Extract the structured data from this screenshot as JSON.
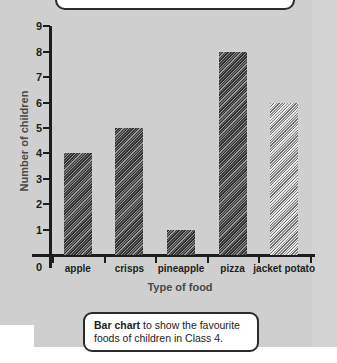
{
  "chart_data": {
    "type": "bar",
    "title": "",
    "categories": [
      "apple",
      "crisps",
      "pineapple",
      "pizza",
      "jacket potato"
    ],
    "values": [
      4,
      5,
      1,
      8,
      6
    ],
    "xlabel": "Type of food",
    "ylabel": "Number of children",
    "ylim": [
      0,
      9
    ],
    "y_ticks": [
      9,
      8,
      7,
      6,
      5,
      4,
      3,
      2,
      1
    ],
    "y_zero_label": "0",
    "grid": false,
    "legend": "none",
    "bar_styles": [
      "dark-hatch",
      "dark-hatch",
      "dark-hatch",
      "dark-hatch",
      "light-hatch"
    ]
  },
  "caption": {
    "bold_lead": "Bar chart",
    "rest": " to show the favourite foods of children in Class 4."
  },
  "colors": {
    "paper": "#cfcfcf",
    "axis": "#1d1d1d",
    "axis_title": "#494949",
    "bar_dark": "#3a3a3a",
    "bar_light": "#d8d8d8",
    "callout_border": "#2b2b2b",
    "callout_fill": "#ffffff"
  }
}
